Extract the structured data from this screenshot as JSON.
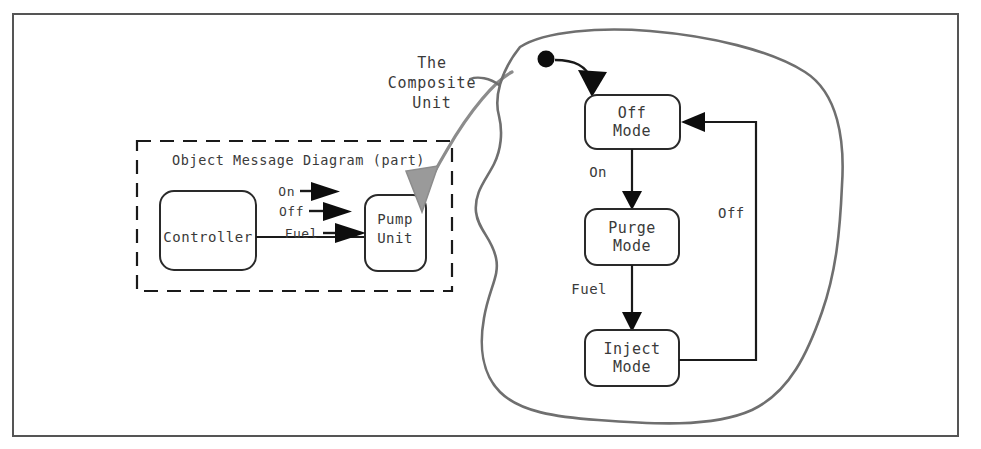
{
  "figure": {
    "title": "The Composite Unit",
    "page_border_color": "#555555",
    "background_color": "#ffffff"
  },
  "callout": {
    "name": "composite-unit-callout",
    "lines": [
      "The",
      "Composite",
      "Unit"
    ],
    "pointer_color": "#8c8c8c"
  },
  "object_message_diagram": {
    "panel_title": "Object Message Diagram (part)",
    "border_style": "dashed",
    "border_color": "#1a1a1a",
    "objects": [
      {
        "id": "controller",
        "label": "Controller"
      },
      {
        "id": "pump-unit",
        "label_line1": "Pump",
        "label_line2": "Unit"
      }
    ],
    "messages": [
      {
        "id": "msg-on",
        "label": "On"
      },
      {
        "id": "msg-off",
        "label": "Off"
      },
      {
        "id": "msg-fuel",
        "label": "Fuel"
      }
    ],
    "link_label": ""
  },
  "state_diagram": {
    "container_name": "composite-unit-cloud",
    "cloud_stroke_color": "#6f6f6f",
    "initial_state": {
      "name": "initial-state-dot",
      "shape": "filled-circle"
    },
    "states": [
      {
        "id": "off-mode",
        "line1": "Off",
        "line2": "Mode"
      },
      {
        "id": "purge-mode",
        "line1": "Purge",
        "line2": "Mode"
      },
      {
        "id": "inject-mode",
        "line1": "Inject",
        "line2": "Mode"
      }
    ],
    "transitions": [
      {
        "id": "t-initial",
        "from": "initial",
        "to": "off-mode",
        "label": ""
      },
      {
        "id": "t-on",
        "from": "off-mode",
        "to": "purge-mode",
        "label": "On"
      },
      {
        "id": "t-fuel",
        "from": "purge-mode",
        "to": "inject-mode",
        "label": "Fuel"
      },
      {
        "id": "t-off",
        "from": "inject-mode",
        "to": "off-mode",
        "label": "Off"
      }
    ]
  }
}
